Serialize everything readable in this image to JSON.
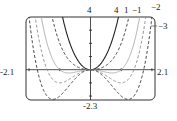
{
  "chart_data": {
    "type": "line",
    "title": "",
    "function_family": "y = x^4 + c x^2",
    "xlim": [
      -2.1,
      2.1
    ],
    "ylim": [
      -2.3,
      4
    ],
    "grid": false,
    "tick_labels": {
      "x_min": "-2.1",
      "x_max": "2.1",
      "y_min": "-2.3",
      "y_max": "4"
    },
    "series": [
      {
        "name": "4",
        "c": 4,
        "style": "solid"
      },
      {
        "name": "1",
        "c": 1,
        "style": "dashed"
      },
      {
        "name": "-1",
        "c": -1,
        "style": "gray"
      },
      {
        "name": "-2",
        "c": -2,
        "style": "dashed-gray"
      },
      {
        "name": "-3",
        "c": -3,
        "style": "dashed"
      }
    ],
    "legend": "curve labels at top right"
  },
  "labels": {
    "ymax": "4",
    "ymin": "-2.3",
    "xmin": "-2.1",
    "xmax": "2.1",
    "c4": "4",
    "c1": "1",
    "cm1": "−1",
    "cm2": "−2",
    "cm3": "−3"
  }
}
